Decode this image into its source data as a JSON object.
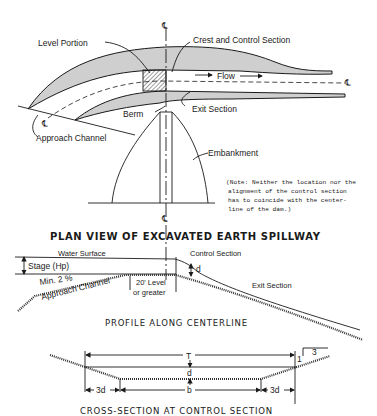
{
  "plan_view": {
    "title": "PLAN VIEW OF EXCAVATED EARTH SPILLWAY",
    "labels": {
      "centerline_top": "℄",
      "level_portion": "Level Portion",
      "crest_control": "Crest and Control Section",
      "flow": "Flow",
      "centerline_right": "℄",
      "exit_section": "Exit Section",
      "berm": "Berm",
      "centerline_channel": "℄",
      "approach_channel": "Approach Channel",
      "embankment": "Embankment",
      "centerline_bottom": "℄"
    },
    "note": [
      "(Note:  Neither the location nor the",
      "alignment of the control section",
      "has to coincide with the center-",
      "line of the dam.)"
    ]
  },
  "profile": {
    "title": "PROFILE ALONG CENTERLINE",
    "labels": {
      "water_surface": "Water Surface",
      "stage": "Stage (Hp)",
      "control_section": "Control Section",
      "d": "d",
      "min_slope": "Min. 2 %",
      "approach_channel": "Approach Channel",
      "level_len": "20' Level",
      "or_greater": "or greater",
      "exit_section": "Exit Section"
    }
  },
  "cross_section": {
    "title": "CROSS-SECTION AT CONTROL SECTION",
    "labels": {
      "T": "T",
      "slope_run": "3",
      "slope_rise": "1",
      "d": "d",
      "left_3d": "3d",
      "b": "b",
      "right_3d": "3d"
    }
  }
}
